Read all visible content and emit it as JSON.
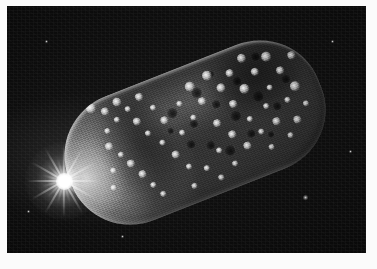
{
  "image": {
    "kind": "astronomical-photograph",
    "palette": "grayscale",
    "caption": "",
    "frame_color": "#fbfbfb",
    "sky_color": "#0a0a0a",
    "body_color": "#8a8a8a",
    "flare_color": "#ffffff"
  },
  "scene": {
    "title": "Elongated cratered icy body backlit by a bright sun flare",
    "subject_label": "planetary-body",
    "light_source_label": "sun-flare",
    "background_label": "starfield"
  },
  "body": {
    "shape": "elongated rounded capsule",
    "tilt_degrees": -21.5,
    "lit_side": "left",
    "terminator_side": "lower-right",
    "surface": "heavily cratered with bright ejecta rays"
  },
  "flare": {
    "position_label": "left limb",
    "x": 55,
    "y": 175,
    "ray_count": 12
  },
  "bright_spots": [
    {
      "x": 46,
      "y": 6,
      "r": 3.6
    },
    {
      "x": 58,
      "y": 14,
      "r": 2.6
    },
    {
      "x": 66,
      "y": 26,
      "r": 2.0
    },
    {
      "x": 72,
      "y": 9,
      "r": 3.0
    },
    {
      "x": 80,
      "y": 20,
      "r": 2.3
    },
    {
      "x": 84,
      "y": 35,
      "r": 2.8
    },
    {
      "x": 90,
      "y": 50,
      "r": 2.1
    },
    {
      "x": 95,
      "y": 13,
      "r": 2.4
    },
    {
      "x": 53,
      "y": 33,
      "r": 2.2
    },
    {
      "x": 49,
      "y": 48,
      "r": 2.6
    },
    {
      "x": 57,
      "y": 60,
      "r": 2.0
    },
    {
      "x": 63,
      "y": 72,
      "r": 2.4
    },
    {
      "x": 70,
      "y": 86,
      "r": 2.9
    },
    {
      "x": 76,
      "y": 100,
      "r": 2.2
    },
    {
      "x": 82,
      "y": 112,
      "r": 1.8
    },
    {
      "x": 44,
      "y": 72,
      "r": 1.9
    },
    {
      "x": 38,
      "y": 88,
      "r": 2.2
    },
    {
      "x": 104,
      "y": 28,
      "r": 2.0
    },
    {
      "x": 110,
      "y": 44,
      "r": 2.5
    },
    {
      "x": 100,
      "y": 64,
      "r": 2.1
    },
    {
      "x": 108,
      "y": 80,
      "r": 2.6
    },
    {
      "x": 116,
      "y": 96,
      "r": 2.2
    },
    {
      "x": 122,
      "y": 62,
      "r": 1.9
    },
    {
      "x": 130,
      "y": 34,
      "r": 2.3
    },
    {
      "x": 138,
      "y": 52,
      "r": 2.0
    },
    {
      "x": 146,
      "y": 22,
      "r": 3.2
    },
    {
      "x": 152,
      "y": 40,
      "r": 2.4
    },
    {
      "x": 158,
      "y": 66,
      "r": 2.7
    },
    {
      "x": 166,
      "y": 18,
      "r": 3.6
    },
    {
      "x": 174,
      "y": 34,
      "r": 3.0
    },
    {
      "x": 180,
      "y": 54,
      "r": 2.4
    },
    {
      "x": 188,
      "y": 24,
      "r": 2.8
    },
    {
      "x": 196,
      "y": 44,
      "r": 3.4
    },
    {
      "x": 204,
      "y": 14,
      "r": 3.0
    },
    {
      "x": 212,
      "y": 32,
      "r": 2.6
    },
    {
      "x": 220,
      "y": 52,
      "r": 2.3
    },
    {
      "x": 228,
      "y": 22,
      "r": 3.2
    },
    {
      "x": 236,
      "y": 40,
      "r": 2.5
    },
    {
      "x": 244,
      "y": 60,
      "r": 3.6
    },
    {
      "x": 252,
      "y": 30,
      "r": 2.4
    },
    {
      "x": 232,
      "y": 70,
      "r": 2.0
    },
    {
      "x": 210,
      "y": 68,
      "r": 2.2
    },
    {
      "x": 190,
      "y": 74,
      "r": 2.0
    },
    {
      "x": 168,
      "y": 82,
      "r": 2.4
    },
    {
      "x": 150,
      "y": 92,
      "r": 2.0
    },
    {
      "x": 132,
      "y": 104,
      "r": 2.2
    },
    {
      "x": 114,
      "y": 116,
      "r": 1.9
    },
    {
      "x": 178,
      "y": 98,
      "r": 2.6
    },
    {
      "x": 196,
      "y": 90,
      "r": 2.1
    },
    {
      "x": 214,
      "y": 86,
      "r": 2.4
    },
    {
      "x": 234,
      "y": 92,
      "r": 2.8
    },
    {
      "x": 248,
      "y": 80,
      "r": 2.2
    },
    {
      "x": 160,
      "y": 110,
      "r": 2.0
    },
    {
      "x": 142,
      "y": 118,
      "r": 1.8
    },
    {
      "x": 200,
      "y": 108,
      "r": 2.2
    },
    {
      "x": 222,
      "y": 104,
      "r": 1.9
    }
  ],
  "dark_pits": [
    {
      "x": 120,
      "y": 40,
      "r": 5.0
    },
    {
      "x": 136,
      "y": 58,
      "r": 4.2
    },
    {
      "x": 150,
      "y": 30,
      "r": 4.6
    },
    {
      "x": 164,
      "y": 48,
      "r": 3.8
    },
    {
      "x": 178,
      "y": 66,
      "r": 5.2
    },
    {
      "x": 192,
      "y": 34,
      "r": 4.0
    },
    {
      "x": 206,
      "y": 56,
      "r": 4.6
    },
    {
      "x": 126,
      "y": 76,
      "r": 4.4
    },
    {
      "x": 144,
      "y": 84,
      "r": 3.6
    },
    {
      "x": 160,
      "y": 96,
      "r": 4.8
    },
    {
      "x": 186,
      "y": 88,
      "r": 4.0
    },
    {
      "x": 204,
      "y": 96,
      "r": 3.4
    },
    {
      "x": 220,
      "y": 72,
      "r": 4.4
    },
    {
      "x": 238,
      "y": 50,
      "r": 3.8
    },
    {
      "x": 112,
      "y": 56,
      "r": 3.4
    },
    {
      "x": 170,
      "y": 18,
      "r": 3.2
    },
    {
      "x": 218,
      "y": 18,
      "r": 3.6
    }
  ],
  "background_stars": [
    {
      "x": 303,
      "y": 196,
      "r": 1.6
    },
    {
      "x": 44,
      "y": 40,
      "r": 1.0
    },
    {
      "x": 330,
      "y": 40,
      "r": 0.9
    },
    {
      "x": 26,
      "y": 210,
      "r": 0.9
    },
    {
      "x": 348,
      "y": 150,
      "r": 0.8
    },
    {
      "x": 120,
      "y": 235,
      "r": 0.9
    }
  ]
}
